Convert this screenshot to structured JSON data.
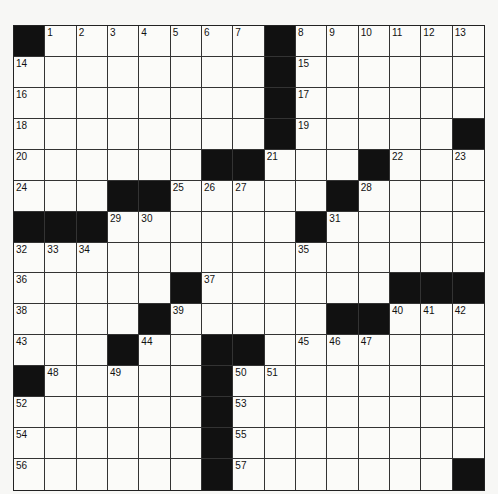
{
  "puzzle": {
    "rows": 15,
    "cols": 15,
    "colors": {
      "black": "#111111",
      "white": "#fbfbf9",
      "grid_line": "#333333"
    },
    "grid": [
      "#.......#......",
      "........#......",
      "........#......",
      "........#.....#",
      "......##...#...",
      "...##.....#....",
      "###......#.....",
      "...............",
      ".....#......###",
      "....#.....##...",
      "...#..##.......",
      "#.....#........",
      "......#........",
      "......#........",
      "......#.......#"
    ],
    "numbers": [
      [
        0,
        1,
        "1"
      ],
      [
        0,
        2,
        "2"
      ],
      [
        0,
        3,
        "3"
      ],
      [
        0,
        4,
        "4"
      ],
      [
        0,
        5,
        "5"
      ],
      [
        0,
        6,
        "6"
      ],
      [
        0,
        7,
        "7"
      ],
      [
        0,
        9,
        "8"
      ],
      [
        0,
        10,
        "9"
      ],
      [
        0,
        11,
        "10"
      ],
      [
        0,
        12,
        "11"
      ],
      [
        0,
        13,
        "12"
      ],
      [
        0,
        14,
        "13"
      ],
      [
        1,
        0,
        "14"
      ],
      [
        1,
        9,
        "15"
      ],
      [
        2,
        0,
        "16"
      ],
      [
        2,
        9,
        "17"
      ],
      [
        3,
        0,
        "18"
      ],
      [
        3,
        9,
        "19"
      ],
      [
        4,
        0,
        "20"
      ],
      [
        4,
        8,
        "21"
      ],
      [
        4,
        12,
        "22"
      ],
      [
        4,
        14,
        "23"
      ],
      [
        5,
        0,
        "24"
      ],
      [
        5,
        5,
        "25"
      ],
      [
        5,
        6,
        "26"
      ],
      [
        5,
        7,
        "27"
      ],
      [
        5,
        11,
        "28"
      ],
      [
        6,
        3,
        "29"
      ],
      [
        6,
        4,
        "30"
      ],
      [
        6,
        10,
        "31"
      ],
      [
        7,
        0,
        "32"
      ],
      [
        7,
        1,
        "33"
      ],
      [
        7,
        2,
        "34"
      ],
      [
        7,
        9,
        "35"
      ],
      [
        8,
        0,
        "36"
      ],
      [
        8,
        6,
        "37"
      ],
      [
        9,
        0,
        "38"
      ],
      [
        9,
        5,
        "39"
      ],
      [
        9,
        12,
        "40"
      ],
      [
        9,
        13,
        "41"
      ],
      [
        9,
        14,
        "42"
      ],
      [
        10,
        0,
        "43"
      ],
      [
        10,
        4,
        "44"
      ],
      [
        10,
        9,
        "45"
      ],
      [
        10,
        10,
        "46"
      ],
      [
        10,
        11,
        "47"
      ],
      [
        11,
        1,
        "48"
      ],
      [
        11,
        3,
        "49"
      ],
      [
        11,
        7,
        "50"
      ],
      [
        11,
        8,
        "51"
      ],
      [
        12,
        0,
        "52"
      ],
      [
        12,
        7,
        "53"
      ],
      [
        13,
        0,
        "54"
      ],
      [
        13,
        7,
        "55"
      ],
      [
        14,
        0,
        "56"
      ],
      [
        14,
        7,
        "57"
      ]
    ]
  }
}
